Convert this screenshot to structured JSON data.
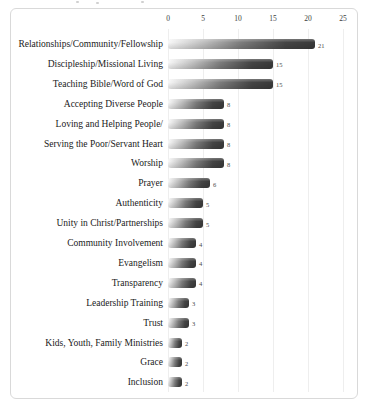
{
  "chart_data": {
    "type": "bar",
    "orientation": "horizontal",
    "title": "",
    "xlabel": "",
    "ylabel": "",
    "categories": [
      "Relationships/Community/Fellowship",
      "Discipleship/Missional Living",
      "Teaching Bible/Word of God",
      "Accepting Diverse People",
      "Loving and Helping People/",
      "Serving the Poor/Servant Heart",
      "Worship",
      "Prayer",
      "Authenticity",
      "Unity in Christ/Partnerships",
      "Community Involvement",
      "Evangelism",
      "Transparency",
      "Leadership Training",
      "Trust",
      "Kids, Youth, Family Ministries",
      "Grace",
      "Inclusion"
    ],
    "values": [
      21,
      15,
      15,
      8,
      8,
      8,
      8,
      6,
      5,
      5,
      4,
      4,
      4,
      3,
      3,
      2,
      2,
      2
    ],
    "value_labels": [
      "21",
      "15",
      "15",
      "8",
      "8",
      "8",
      "8",
      "6",
      "5",
      "5",
      "4",
      "4",
      "4",
      "3",
      "3",
      "2",
      "2",
      "2"
    ],
    "xlim": [
      0,
      25
    ],
    "xticks": [
      "0",
      "5",
      "10",
      "15",
      "20",
      "25"
    ],
    "axis_position": "top",
    "grid": "vertical-faint",
    "legend": "none",
    "colors": {
      "bar_gradient_start": "#f8f8f8",
      "bar_gradient_end": "#3a3a3a",
      "frame_border": "#d9d9d9",
      "grid_line": "#eeeeee",
      "tick_text": "#3d3d3d",
      "category_text": "#1a1a1a",
      "value_text": "#4a4a4a"
    }
  }
}
